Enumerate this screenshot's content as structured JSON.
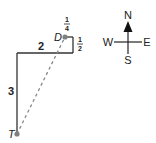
{
  "diagram": {
    "path_labels": {
      "south_leg": "3",
      "west_leg": "2",
      "north_leg": "1/2",
      "east_leg": "1/4"
    },
    "fractions": {
      "north_leg": {
        "num": "1",
        "den": "2"
      },
      "east_leg": {
        "num": "1",
        "den": "4"
      }
    },
    "points": {
      "start": "T",
      "end": "D"
    },
    "compass": {
      "north": "N",
      "south": "S",
      "east": "E",
      "west": "W"
    },
    "colors": {
      "path": "#333333",
      "dashed": "#888888",
      "point": "#808080"
    }
  }
}
